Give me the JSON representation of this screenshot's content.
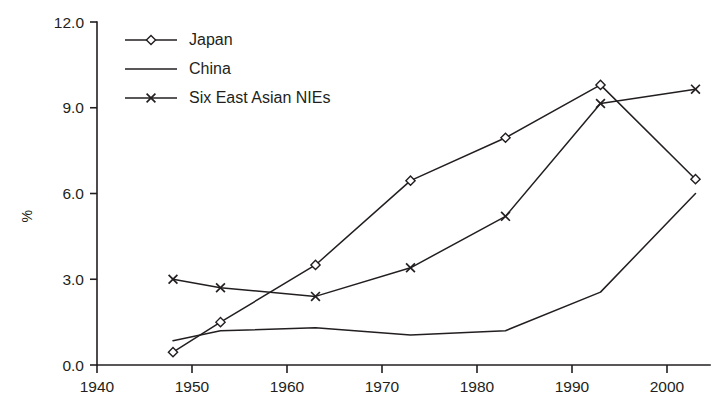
{
  "chart_data": {
    "type": "line",
    "title": "",
    "xlabel": "",
    "ylabel": "%",
    "xlim": [
      1938,
      2006
    ],
    "ylim": [
      0.0,
      12.0
    ],
    "grid": false,
    "legend_position": "top-left",
    "x_ticks": [
      "1940",
      "1950",
      "1960",
      "1970",
      "1980",
      "1990",
      "2000"
    ],
    "x_tick_values": [
      1940,
      1950,
      1960,
      1970,
      1980,
      1990,
      2000
    ],
    "y_ticks": [
      "0.0",
      "3.0",
      "6.0",
      "9.0",
      "12.0"
    ],
    "y_tick_values": [
      0.0,
      3.0,
      6.0,
      9.0,
      12.0
    ],
    "x": [
      1948,
      1953,
      1963,
      1973,
      1983,
      1993,
      2003
    ],
    "series": [
      {
        "name": "Japan",
        "marker": "diamond",
        "values": [
          0.45,
          1.5,
          3.5,
          6.45,
          7.95,
          9.8,
          6.5
        ]
      },
      {
        "name": "China",
        "marker": "none",
        "values": [
          0.85,
          1.2,
          1.3,
          1.05,
          1.2,
          2.55,
          6.0
        ]
      },
      {
        "name": "Six East Asian NIEs",
        "marker": "cross",
        "values": [
          3.0,
          2.7,
          2.4,
          3.4,
          5.2,
          9.15,
          9.65
        ]
      }
    ]
  },
  "legend": {
    "entries": [
      {
        "label": "Japan",
        "marker": "diamond"
      },
      {
        "label": "China",
        "marker": "none"
      },
      {
        "label": "Six East Asian NIEs",
        "marker": "cross"
      }
    ]
  },
  "colors": {
    "ink": "#231f20",
    "background": "#ffffff"
  }
}
